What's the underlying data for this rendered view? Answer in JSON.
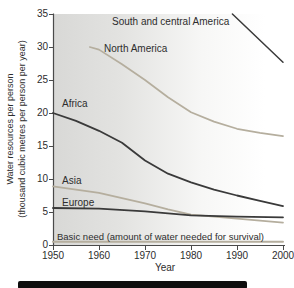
{
  "colors": {
    "dark_line": "#3a3a3a",
    "light_line": "#b5ae9e",
    "axis": "#4a4a4a",
    "text": "#2d2d2d",
    "plot_bg_left": "#d8d8d6",
    "footer_bar": "#0e0e0e"
  },
  "axis": {
    "xlabel": "Year",
    "ylabel_line1": "Water resources per person",
    "ylabel_line2": "(thousand cubic metres per person per year)"
  },
  "series_labels": {
    "south_central_america": "South and central America",
    "north_america": "North America",
    "africa": "Africa",
    "asia": "Asia",
    "europe": "Europe",
    "basic_need": "Basic need (amount of water needed for survival)"
  },
  "chart_data": {
    "type": "line",
    "title": "",
    "xlabel": "Year",
    "ylabel": "Water resources per person (thousand cubic metres per person per year)",
    "xlim": [
      1950,
      2000
    ],
    "ylim": [
      0,
      35
    ],
    "x_ticks": [
      1950,
      1960,
      1970,
      1980,
      1990,
      2000
    ],
    "y_ticks": [
      0,
      5,
      10,
      15,
      20,
      25,
      30,
      35
    ],
    "grid": false,
    "legend": "inline-labels",
    "series": [
      {
        "id": "south-central-america",
        "name": "South and central America",
        "color": "dark",
        "width": 1.5,
        "x": [
          1989,
          2000
        ],
        "values": [
          35,
          27.7
        ]
      },
      {
        "id": "north-america",
        "name": "North America",
        "color": "light",
        "width": 1.7,
        "x": [
          1958,
          1960,
          1965,
          1970,
          1975,
          1980,
          1985,
          1990,
          1995,
          2000
        ],
        "values": [
          30,
          29.6,
          27.4,
          25,
          22.4,
          20.1,
          18.7,
          17.6,
          17,
          16.5
        ]
      },
      {
        "id": "africa",
        "name": "Africa",
        "color": "dark",
        "width": 1.8,
        "x": [
          1950,
          1955,
          1960,
          1965,
          1970,
          1975,
          1980,
          1985,
          1990,
          1995,
          2000
        ],
        "values": [
          20,
          18.8,
          17.3,
          15.5,
          12.8,
          10.8,
          9.5,
          8.4,
          7.5,
          6.7,
          5.9
        ]
      },
      {
        "id": "asia",
        "name": "Asia",
        "color": "light",
        "width": 1.7,
        "x": [
          1950,
          1960,
          1970,
          1975,
          1980,
          1985,
          1990,
          1995,
          2000
        ],
        "values": [
          8.9,
          7.9,
          6.3,
          5.4,
          4.6,
          4.3,
          4.0,
          3.7,
          3.4
        ]
      },
      {
        "id": "europe",
        "name": "Europe",
        "color": "dark",
        "width": 1.8,
        "x": [
          1950,
          1960,
          1970,
          1980,
          1990,
          2000
        ],
        "values": [
          5.6,
          5.5,
          5.1,
          4.5,
          4.3,
          4.2
        ]
      },
      {
        "id": "basic-need",
        "name": "Basic need (amount of water needed for survival)",
        "color": "light",
        "width": 2,
        "x": [
          1950,
          2000
        ],
        "values": [
          0.5,
          0.5
        ]
      }
    ]
  }
}
